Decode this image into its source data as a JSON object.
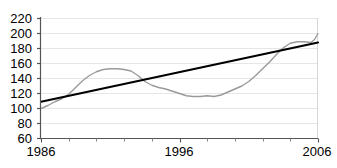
{
  "chart_data": {
    "type": "line",
    "title": "",
    "subtitle": "",
    "xlabel": "",
    "ylabel": "",
    "xlim": [
      1986,
      2006
    ],
    "ylim": [
      60,
      220
    ],
    "grid": true,
    "legend": false,
    "y_ticks": [
      220,
      200,
      180,
      160,
      140,
      120,
      100,
      80,
      60
    ],
    "y_tick_labels": [
      "220",
      "200",
      "180",
      "160",
      "140",
      "120",
      "100",
      "80",
      "60"
    ],
    "x_ticks": [
      1986,
      1988,
      1990,
      1992,
      1994,
      1996,
      1998,
      2000,
      2002,
      2004,
      2006
    ],
    "x_tick_labels": [
      "1986",
      "",
      "",
      "",
      "",
      "1996",
      "",
      "",
      "",
      "",
      "2006"
    ],
    "x_labeled_ticks": [
      "1986",
      "1996",
      "2006"
    ],
    "series": [
      {
        "name": "index-series",
        "type": "line",
        "color": "#9a9a9a",
        "width": 1.4,
        "x": [
          1986,
          1986.5,
          1987,
          1987.5,
          1988,
          1988.5,
          1989,
          1989.5,
          1990,
          1990.5,
          1991,
          1991.5,
          1992,
          1992.5,
          1993,
          1993.5,
          1994,
          1994.5,
          1995,
          1995.5,
          1996,
          1996.5,
          1997,
          1997.5,
          1998,
          1998.5,
          1999,
          1999.5,
          2000,
          2000.5,
          2001,
          2001.5,
          2002,
          2002.5,
          2003,
          2003.5,
          2004,
          2004.5,
          2005,
          2005.5,
          2006
        ],
        "values": [
          100,
          104,
          109,
          113,
          119,
          128,
          137,
          144,
          149,
          152,
          153,
          153,
          152,
          150,
          144,
          136,
          131,
          128,
          126,
          123,
          120,
          117,
          116,
          116,
          117,
          116,
          118,
          122,
          126,
          130,
          136,
          144,
          153,
          162,
          172,
          181,
          187,
          189,
          189,
          188,
          189
        ]
      },
      {
        "name": "trend-line",
        "type": "line",
        "color": "#000000",
        "width": 2.2,
        "x": [
          1986,
          2006
        ],
        "values": [
          109,
          188
        ]
      }
    ],
    "series_tail": {
      "name": "index-series-final-rise",
      "x": [
        2005.5,
        2005.75,
        2006
      ],
      "values": [
        188,
        192,
        200
      ]
    },
    "axis_color": "#6f6f6f",
    "grid_color": "#e3e3e3",
    "background": "#ffffff"
  }
}
